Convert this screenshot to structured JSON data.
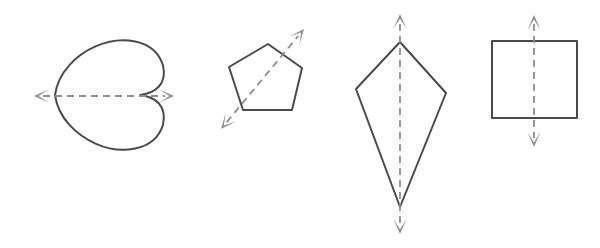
{
  "figure": {
    "title": "Shapes with one line of symmetry",
    "background_color": "#ffffff",
    "shape_stroke_color": "#4a4a4a",
    "axis_color": "#8d8d8d",
    "axis_style": "dashed with arrowheads on both ends",
    "width": 600,
    "height": 248,
    "shape_count": 4,
    "shapes": [
      {
        "id": "heart",
        "name": "heart",
        "label": "Heart",
        "orientation": "rotated 90 degrees counter-clockwise, apex points left",
        "symmetry_axis": {
          "orientation": "horizontal",
          "start": [
            34,
            96
          ],
          "end": [
            174,
            96
          ],
          "arrowheads": "both"
        },
        "bounds": {
          "x": 55,
          "y": 42,
          "width": 108,
          "height": 106
        }
      },
      {
        "id": "pentagon",
        "name": "regular-pentagon",
        "label": "Pentagon",
        "orientation": "tilted, one vertex at lower left",
        "vertices": [
          [
            268,
            44
          ],
          [
            302,
            68
          ],
          [
            292,
            110
          ],
          [
            243,
            110
          ],
          [
            229,
            67
          ]
        ],
        "symmetry_axis": {
          "orientation": "diagonal, lower-left to upper-right",
          "start": [
            221,
            129
          ],
          "end": [
            304,
            29
          ],
          "arrowheads": "both"
        },
        "bounds": {
          "x": 229,
          "y": 44,
          "width": 73,
          "height": 66
        }
      },
      {
        "id": "kite",
        "name": "kite",
        "label": "Kite",
        "orientation": "upright, long axis vertical",
        "vertices": [
          [
            400,
            42
          ],
          [
            446,
            93
          ],
          [
            400,
            207
          ],
          [
            356,
            89
          ]
        ],
        "symmetry_axis": {
          "orientation": "vertical",
          "start": [
            400,
            14
          ],
          "end": [
            400,
            234
          ],
          "arrowheads": "both"
        },
        "bounds": {
          "x": 356,
          "y": 42,
          "width": 90,
          "height": 165
        }
      },
      {
        "id": "square",
        "name": "square",
        "label": "Square",
        "orientation": "axis-aligned",
        "vertices": [
          [
            492,
            41
          ],
          [
            577,
            41
          ],
          [
            577,
            118
          ],
          [
            492,
            118
          ]
        ],
        "symmetry_axis": {
          "orientation": "vertical",
          "start": [
            534,
            15
          ],
          "end": [
            534,
            147
          ],
          "arrowheads": "both"
        },
        "bounds": {
          "x": 492,
          "y": 41,
          "width": 85,
          "height": 77
        }
      }
    ]
  }
}
